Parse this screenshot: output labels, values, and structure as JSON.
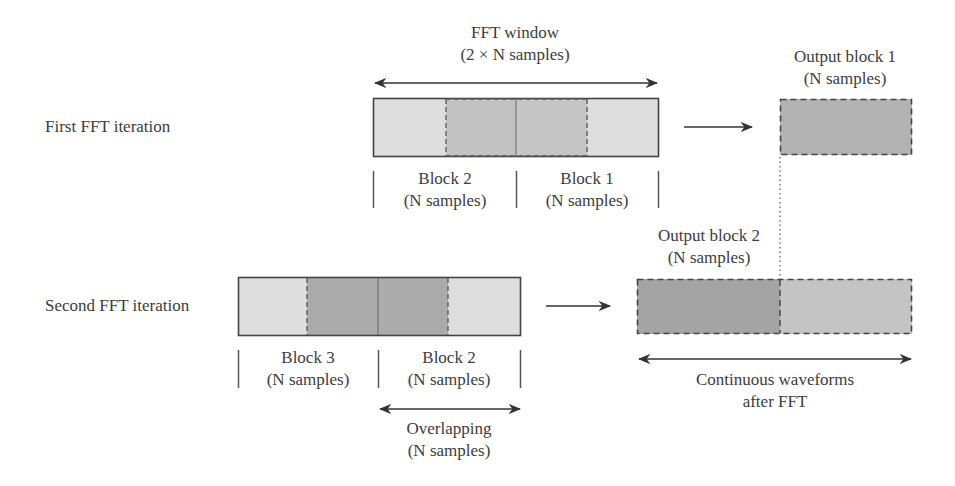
{
  "diagram": {
    "colors": {
      "light": "#dedede",
      "medium": "#c2c2c2",
      "dark": "#a9a9a9",
      "output1": "#b3b3b3",
      "output2_left": "#a4a4a4",
      "output2_right": "#c4c4c4",
      "stroke": "#444444"
    },
    "first_iteration": {
      "row_label": "First FFT iteration",
      "window_label": "FFT window",
      "window_sublabel": "(2 × N samples)",
      "blocks": [
        {
          "name": "Block 2",
          "samples": "(N samples)"
        },
        {
          "name": "Block 1",
          "samples": "(N samples)"
        }
      ],
      "output_label": "Output block 1",
      "output_sublabel": "(N samples)"
    },
    "second_iteration": {
      "row_label": "Second FFT iteration",
      "blocks": [
        {
          "name": "Block 3",
          "samples": "(N samples)"
        },
        {
          "name": "Block 2",
          "samples": "(N samples)"
        }
      ],
      "overlap_label": "Overlapping",
      "overlap_sublabel": "(N samples)",
      "output_label": "Output block 2",
      "output_sublabel": "(N samples)"
    },
    "continuous_label": "Continuous waveforms",
    "continuous_sublabel": "after FFT"
  }
}
